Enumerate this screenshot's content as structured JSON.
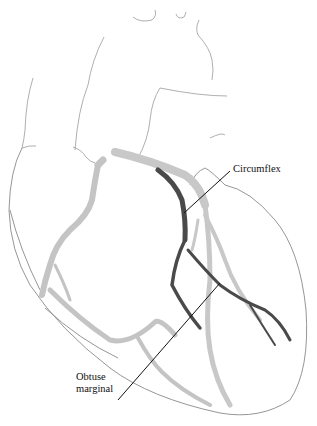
{
  "figure": {
    "labels": [
      {
        "id": "circumflex",
        "text": "Circumflex"
      },
      {
        "id": "obtuse-marginal",
        "lines": [
          "Obtuse",
          "marginal"
        ]
      }
    ],
    "colors": {
      "background": "#ffffff",
      "outline": "#8a8a8a",
      "circumflex_artery": "#4a4a4a",
      "other_arteries": "#bdbdbd",
      "leader_line": "#111111",
      "label_text": "#111111"
    }
  }
}
